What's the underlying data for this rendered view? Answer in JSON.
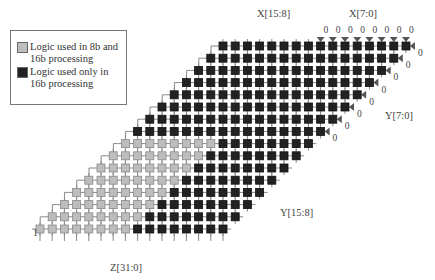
{
  "legend": {
    "items": [
      {
        "label_line1": "Logic used in 8b and",
        "label_line2": "16b processing",
        "color": "#bdbdbd"
      },
      {
        "label_line1": "Logic used only in",
        "label_line2": "16b processing",
        "color": "#222222"
      }
    ]
  },
  "labels": {
    "x_high": "X[15:8]",
    "x_low": "X[7:0]",
    "y_low": "Y[7:0]",
    "y_high": "Y[15:8]",
    "z_out": "Z[31:0]",
    "zero": "0",
    "one": "1"
  },
  "array": {
    "rows": 16,
    "cols": 16,
    "gray_color": "#bdbdbd",
    "black_color": "#222222",
    "marker_color": "#555555"
  }
}
